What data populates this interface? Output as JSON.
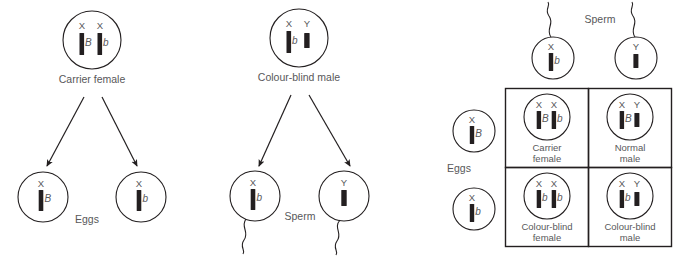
{
  "figure": {
    "stroke_color": "#231f20",
    "text_color": "#58585a",
    "background": "#ffffff"
  },
  "panels": {
    "female_cross": {
      "parent": {
        "caption": "Carrier female",
        "chromosomes": [
          {
            "label": "X",
            "allele": "B",
            "type": "x"
          },
          {
            "label": "X",
            "allele": "b",
            "type": "x"
          }
        ]
      },
      "gametes_label": "Eggs",
      "gametes": [
        {
          "chromosomes": [
            {
              "label": "X",
              "allele": "B",
              "type": "x"
            }
          ]
        },
        {
          "chromosomes": [
            {
              "label": "X",
              "allele": "b",
              "type": "x"
            }
          ]
        }
      ]
    },
    "male_cross": {
      "parent": {
        "caption": "Colour-blind male",
        "chromosomes": [
          {
            "label": "X",
            "allele": "b",
            "type": "x"
          },
          {
            "label": "Y",
            "allele": "",
            "type": "y"
          }
        ]
      },
      "gametes_label": "Sperm",
      "gametes": [
        {
          "chromosomes": [
            {
              "label": "X",
              "allele": "b",
              "type": "x"
            }
          ]
        },
        {
          "chromosomes": [
            {
              "label": "Y",
              "allele": "",
              "type": "y"
            }
          ]
        }
      ]
    },
    "punnett": {
      "column_header_label": "Sperm",
      "row_header_label": "Eggs",
      "columns": [
        {
          "chromosomes": [
            {
              "label": "X",
              "allele": "b",
              "type": "x"
            }
          ]
        },
        {
          "chromosomes": [
            {
              "label": "Y",
              "allele": "",
              "type": "y"
            }
          ]
        }
      ],
      "rows": [
        {
          "chromosomes": [
            {
              "label": "X",
              "allele": "B",
              "type": "x"
            }
          ]
        },
        {
          "chromosomes": [
            {
              "label": "X",
              "allele": "b",
              "type": "x"
            }
          ]
        }
      ],
      "offspring": [
        {
          "caption_line1": "Carrier",
          "caption_line2": "female",
          "chromosomes": [
            {
              "label": "X",
              "allele": "B",
              "type": "x"
            },
            {
              "label": "X",
              "allele": "b",
              "type": "x"
            }
          ]
        },
        {
          "caption_line1": "Normal",
          "caption_line2": "male",
          "chromosomes": [
            {
              "label": "X",
              "allele": "B",
              "type": "x"
            },
            {
              "label": "Y",
              "allele": "",
              "type": "y"
            }
          ]
        },
        {
          "caption_line1": "Colour-blind",
          "caption_line2": "female",
          "chromosomes": [
            {
              "label": "X",
              "allele": "b",
              "type": "x"
            },
            {
              "label": "X",
              "allele": "b",
              "type": "x"
            }
          ]
        },
        {
          "caption_line1": "Colour-blind",
          "caption_line2": "male",
          "chromosomes": [
            {
              "label": "X",
              "allele": "b",
              "type": "x"
            },
            {
              "label": "Y",
              "allele": "",
              "type": "y"
            }
          ]
        }
      ]
    }
  }
}
